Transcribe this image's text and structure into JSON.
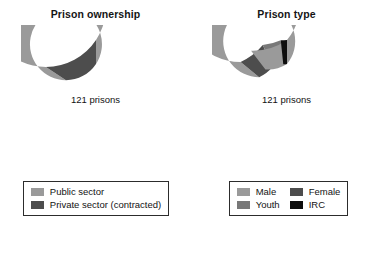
{
  "figure": {
    "background": "#ffffff",
    "width": 382,
    "height": 259
  },
  "palette": {
    "light_gray": "#9a9a9a",
    "medium_gray": "#787878",
    "dark_gray": "#4d4d4d",
    "black": "#0d0d0d",
    "legend_border": "#2c2c2c",
    "text": "#151515"
  },
  "panels": [
    {
      "title": "Prison ownership",
      "center_label": "121 prisons",
      "legend_layout": "one-column",
      "legend": [
        {
          "label": "Public sector",
          "color": "#9a9a9a"
        },
        {
          "label": "Private sector (contracted)",
          "color": "#4d4d4d"
        }
      ]
    },
    {
      "title": "Prison type",
      "center_label": "121 prisons",
      "legend_layout": "two-column",
      "legend": [
        {
          "label": "Male",
          "color": "#9a9a9a"
        },
        {
          "label": "Female",
          "color": "#4d4d4d"
        },
        {
          "label": "Youth",
          "color": "#787878"
        },
        {
          "label": "IRC",
          "color": "#0d0d0d"
        }
      ]
    }
  ],
  "chart_data": [
    {
      "type": "pie",
      "variant": "donut",
      "title": "Prison ownership",
      "center_label": "121 prisons",
      "total": 121,
      "total_unit": "prisons",
      "start_angle_deg": 0,
      "direction": "counterclockwise",
      "inner_radius_ratio": 0.6,
      "categories": [
        "Public sector",
        "Private sector (contracted)"
      ],
      "values": [
        102,
        19
      ],
      "percentages": [
        84.3,
        15.7
      ],
      "colors": [
        "#9a9a9a",
        "#4d4d4d"
      ],
      "legend_position": "bottom",
      "grid": false
    },
    {
      "type": "pie",
      "variant": "donut",
      "title": "Prison type",
      "center_label": "121 prisons",
      "total": 121,
      "total_unit": "prisons",
      "start_angle_deg": 0,
      "direction": "counterclockwise",
      "inner_radius_ratio": 0.6,
      "categories": [
        "IRC",
        "Youth",
        "Female",
        "Male"
      ],
      "values": [
        2,
        6,
        9,
        104
      ],
      "percentages": [
        1.7,
        5.0,
        7.4,
        85.9
      ],
      "colors": [
        "#0d0d0d",
        "#787878",
        "#4d4d4d",
        "#9a9a9a"
      ],
      "legend_position": "bottom",
      "legend_order": [
        "Male",
        "Female",
        "Youth",
        "IRC"
      ],
      "grid": false
    }
  ]
}
